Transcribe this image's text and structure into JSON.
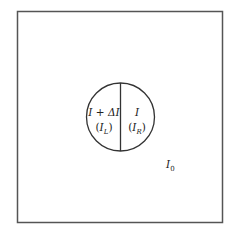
{
  "diagram": {
    "left_label": {
      "main": "I + ΔI",
      "sub_open": "(",
      "sub_var": "I",
      "sub_sub": "L",
      "sub_close": ")"
    },
    "right_label": {
      "main": "I",
      "sub_open": "(",
      "sub_var": "I",
      "sub_sub": "R",
      "sub_close": ")"
    },
    "background_label": {
      "var": "I",
      "sub": "0"
    },
    "colors": {
      "stroke": "#333333",
      "background": "#ffffff"
    }
  }
}
